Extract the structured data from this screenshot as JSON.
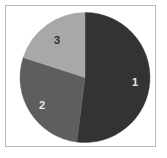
{
  "figure": {
    "background_color": "#ffffff",
    "frame_color": "#b9b9b9"
  },
  "chart_data": {
    "type": "pie",
    "title": "",
    "subtitle": "",
    "xlabel": "",
    "ylabel": "",
    "grid": false,
    "legend": "none",
    "labels_position": "inside-slices",
    "start_angle_deg": 0,
    "direction": "clockwise",
    "center": {
      "x": 85,
      "y": 77.5
    },
    "radius": 65,
    "categories": [
      "1",
      "2",
      "3"
    ],
    "values": [
      52,
      28,
      20
    ],
    "value_unit": "percent",
    "angles_deg": [
      187.2,
      100.8,
      72.0
    ],
    "colors": [
      "#333333",
      "#5e5e5e",
      "#a8a8a8"
    ],
    "slices": [
      {
        "label": "1",
        "value": 52,
        "angle_deg": 187.2,
        "color": "#333333",
        "label_color": "#e8e8e8",
        "label_x": 135,
        "label_y": 82
      },
      {
        "label": "2",
        "value": 28,
        "angle_deg": 100.8,
        "color": "#5e5e5e",
        "label_color": "#e8e8e8",
        "label_x": 42,
        "label_y": 105
      },
      {
        "label": "3",
        "value": 20,
        "angle_deg": 72.0,
        "color": "#a8a8a8",
        "label_color": "#2a2a2a",
        "label_x": 57,
        "label_y": 40
      }
    ]
  }
}
